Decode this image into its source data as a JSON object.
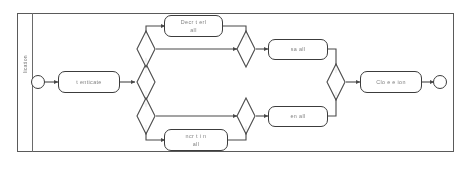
{
  "diagram": {
    "type": "bpmn-process-flow",
    "lane": {
      "label": "lication"
    },
    "events": [
      {
        "name": "start-event",
        "label": ""
      },
      {
        "name": "end-event",
        "label": ""
      }
    ],
    "tasks": [
      {
        "id": "authenticate",
        "label": "t enticate",
        "line1": "t enticate",
        "line2": ""
      },
      {
        "id": "decrypt-recall",
        "label": "Decr t erl all",
        "line1": "Decr  t   erl",
        "line2": "all"
      },
      {
        "id": "encrypt-recall",
        "label": "ncr t i n all",
        "line1": "ncr   t  i  n",
        "line2": "all"
      },
      {
        "id": "save-call",
        "label": "sa       all",
        "line1": "sa           all",
        "line2": ""
      },
      {
        "id": "send-call",
        "label": "en       all",
        "line1": "en           all",
        "line2": ""
      },
      {
        "id": "close-session",
        "label": "Clo e  e  ion",
        "line1": "Clo e  e  ion",
        "line2": ""
      }
    ],
    "gateways": [
      {
        "id": "gateway-split-main",
        "label": ""
      },
      {
        "id": "gateway-split-upper",
        "label": ""
      },
      {
        "id": "gateway-split-lower",
        "label": ""
      },
      {
        "id": "gateway-merge-upper",
        "label": ""
      },
      {
        "id": "gateway-merge-lower",
        "label": ""
      },
      {
        "id": "gateway-merge-main",
        "label": ""
      }
    ],
    "colors": {
      "stroke": "#3c3c3c",
      "pool_border": "#5a5a5a",
      "background": "#ffffff",
      "text": "#2b2b2b"
    }
  }
}
